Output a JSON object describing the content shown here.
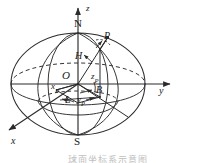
{
  "figure": {
    "type": "geometry-diagram",
    "canvas": {
      "width": 216,
      "height": 163
    },
    "colors": {
      "stroke": "#2b2b2b",
      "dashed": "#2b2b2b",
      "background": "#ffffff",
      "caption": "#8a8a8a"
    },
    "axes": [
      {
        "name": "z-axis",
        "label": "z",
        "direction": "up",
        "label_x": 86,
        "label_y": 5
      },
      {
        "name": "y-axis",
        "label": "y",
        "direction": "right",
        "label_x": 159,
        "label_y": 88
      },
      {
        "name": "x-axis",
        "label": "x",
        "direction": "down-left",
        "label_x": 12,
        "label_y": 138
      }
    ],
    "points": [
      {
        "name": "north-pole",
        "label": "N",
        "upright": true,
        "label_x": 75,
        "label_y": 19
      },
      {
        "name": "south-pole",
        "label": "S",
        "upright": true,
        "label_x": 75,
        "label_y": 137
      },
      {
        "name": "origin",
        "label": "O",
        "upright": false,
        "label_x": 63,
        "label_y": 71
      },
      {
        "name": "point-p",
        "label": "P",
        "upright": false,
        "label_x": 104,
        "label_y": 33
      },
      {
        "name": "point-h",
        "label": "H",
        "upright": false,
        "label_x": 76,
        "label_y": 53
      },
      {
        "name": "point-b",
        "label": "B",
        "upright": false,
        "label_x": 96,
        "label_y": 87
      }
    ],
    "coordinate_labels": [
      {
        "name": "x-p-label",
        "base": "x",
        "sub": "P",
        "label_x": 52,
        "label_y": 83
      },
      {
        "name": "y-p-label",
        "base": "y",
        "sub": "P",
        "label_x": 78,
        "label_y": 96
      },
      {
        "name": "z-p-label",
        "base": "z",
        "sub": "P",
        "label_x": 92,
        "label_y": 74
      },
      {
        "name": "longitude-label",
        "base": "L",
        "sub": "",
        "label_x": 66,
        "label_y": 96
      }
    ],
    "caption_text": "球面坐标系示意图"
  }
}
